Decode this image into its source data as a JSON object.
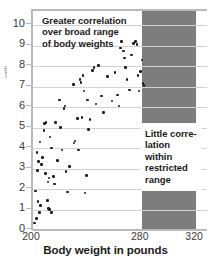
{
  "chart_data": {
    "type": "scatter",
    "title": "",
    "xlabel": "Body weight in pounds",
    "ylabel": "Strength",
    "xlim": [
      200,
      328
    ],
    "ylim": [
      0,
      10.7
    ],
    "grid": true,
    "legend": "none",
    "xticks": [
      {
        "value": 200,
        "label": "200"
      },
      {
        "value": 280,
        "label": "280"
      },
      {
        "value": 320,
        "label": "320"
      }
    ],
    "yticks": [
      {
        "value": 0,
        "label": "0"
      },
      {
        "value": 1,
        "label": "1"
      },
      {
        "value": 2,
        "label": "2"
      },
      {
        "value": 3,
        "label": "3"
      },
      {
        "value": 4,
        "label": "4"
      },
      {
        "value": 5,
        "label": "5"
      },
      {
        "value": 6,
        "label": "6"
      },
      {
        "value": 7,
        "label": "7"
      },
      {
        "value": 8,
        "label": "8"
      },
      {
        "value": 9,
        "label": "9"
      },
      {
        "value": 10,
        "label": "10"
      }
    ],
    "series": [
      {
        "name": "body weight vs strength",
        "marker": "circle",
        "color": "#1a1a1a",
        "points": [
          [
            201.2,
            0.35
          ],
          [
            202.4,
            0.55
          ],
          [
            202.0,
            1.9
          ],
          [
            203.4,
            2.9
          ],
          [
            203.0,
            3.8
          ],
          [
            204.2,
            3.35
          ],
          [
            205.0,
            4.3
          ],
          [
            203.6,
            1.4
          ],
          [
            204.6,
            0.85
          ],
          [
            205.4,
            1.2
          ],
          [
            206.4,
            3.2
          ],
          [
            207.0,
            3.55
          ],
          [
            208.6,
            5.2
          ],
          [
            209.6,
            5.25
          ],
          [
            208.2,
            4.85
          ],
          [
            209.0,
            2.75
          ],
          [
            210.8,
            1.45
          ],
          [
            211.6,
            1.05
          ],
          [
            211.0,
            2.35
          ],
          [
            211.8,
            2.55
          ],
          [
            212.6,
            4.55
          ],
          [
            213.4,
            4.0
          ],
          [
            212.2,
            1.0
          ],
          [
            213.8,
            0.85
          ],
          [
            215.0,
            2.6
          ],
          [
            216.0,
            2.25
          ],
          [
            216.6,
            5.25
          ],
          [
            218.0,
            3.4
          ],
          [
            219.4,
            6.35
          ],
          [
            220.4,
            5.0
          ],
          [
            221.2,
            3.9
          ],
          [
            222.8,
            5.95
          ],
          [
            223.6,
            6.05
          ],
          [
            224.2,
            2.85
          ],
          [
            225.4,
            1.85
          ],
          [
            227.0,
            3.1
          ],
          [
            229.6,
            7.1
          ],
          [
            230.2,
            4.25
          ],
          [
            231.0,
            4.35
          ],
          [
            232.6,
            5.45
          ],
          [
            233.4,
            3.9
          ],
          [
            234.6,
            7.35
          ],
          [
            235.2,
            7.2
          ],
          [
            236.0,
            5.5
          ],
          [
            236.8,
            7.55
          ],
          [
            237.6,
            6.8
          ],
          [
            238.4,
            1.8
          ],
          [
            239.2,
            2.65
          ],
          [
            240.0,
            6.35
          ],
          [
            241.0,
            4.9
          ],
          [
            242.0,
            5.4
          ],
          [
            243.6,
            7.8
          ],
          [
            245.0,
            7.95
          ],
          [
            246.4,
            6.15
          ],
          [
            248.0,
            8.05
          ],
          [
            250.4,
            6.55
          ],
          [
            252.0,
            5.75
          ],
          [
            255.0,
            7.5
          ],
          [
            258.0,
            6.3
          ],
          [
            260.2,
            7.7
          ],
          [
            262.0,
            6.6
          ],
          [
            263.4,
            6.05
          ],
          [
            265.0,
            9.2
          ],
          [
            266.6,
            8.75
          ],
          [
            264.2,
            8.9
          ],
          [
            267.4,
            8.4
          ],
          [
            268.0,
            7.95
          ],
          [
            269.2,
            7.35
          ],
          [
            271.0,
            6.85
          ],
          [
            272.4,
            8.55
          ],
          [
            273.8,
            9.1
          ],
          [
            275.6,
            9.2
          ],
          [
            276.4,
            9.05
          ],
          [
            277.2,
            7.55
          ],
          [
            278.0,
            6.8
          ],
          [
            279.0,
            7.75
          ],
          [
            280.2,
            8.3
          ],
          [
            281.0,
            7.15
          ],
          [
            281.6,
            7.05
          ]
        ]
      }
    ],
    "shaded_regions": [
      {
        "name": "restricted-range-band",
        "x_from": 280,
        "x_to": 320,
        "color": "#7d7d7d",
        "label": "restricted range of body weights"
      }
    ],
    "annotations": [
      {
        "name": "broad-range-note",
        "text": "Greater correlation over broad range of body weights",
        "lines": [
          "Greater correlation",
          "over broad range",
          "of body weights"
        ]
      },
      {
        "name": "restricted-range-note",
        "text": "Little correlation within restricted range",
        "lines": [
          "Little corre-",
          "lation within",
          "restricted",
          "range"
        ]
      }
    ],
    "colors": {
      "point": "#1a1a1a",
      "band": "#7d7d7d",
      "grid": "#d2d2d2",
      "axis": "#b9b9b9",
      "text": "#1a1a1a"
    }
  }
}
